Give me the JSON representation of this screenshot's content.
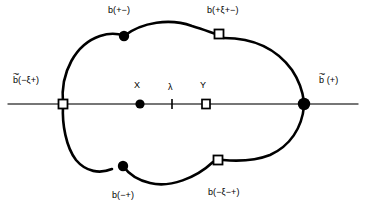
{
  "figure": {
    "background_color": "#ffffff",
    "stroke_color": "#000000",
    "axis_color": "#555555",
    "width": 366,
    "height": 216,
    "labels": {
      "top_left_node": "b(+−)",
      "top_right_node": "b(+ξ+−)",
      "left_axis_node_prefix": "b",
      "left_axis_node_suffix": "(−ξ+)",
      "right_axis_node_prefix": "b",
      "right_axis_node_suffix": " (+)",
      "axis_point_x": "X",
      "axis_point_lambda": "λ",
      "axis_point_y": "Y",
      "bottom_left_node": "b(−+)",
      "bottom_right_node": "b(−ξ−+)",
      "tilde_mark": "~"
    },
    "markers": [
      {
        "name": "top-left-filled-dot",
        "shape": "filled-circle",
        "x": 124,
        "y": 36,
        "r": 5
      },
      {
        "name": "top-right-open-square",
        "shape": "open-square",
        "x": 219,
        "y": 34,
        "size": 9
      },
      {
        "name": "left-axis-open-square",
        "shape": "open-square",
        "x": 63,
        "y": 104,
        "size": 9
      },
      {
        "name": "right-axis-filled-dot",
        "shape": "filled-circle",
        "x": 304,
        "y": 104,
        "r": 6
      },
      {
        "name": "axis-point-x-filled-dot",
        "shape": "filled-circle",
        "x": 140,
        "y": 104,
        "r": 4.5
      },
      {
        "name": "axis-point-lambda-tick",
        "shape": "tick",
        "x": 172,
        "y": 104,
        "size": 9
      },
      {
        "name": "axis-point-y-open-square",
        "shape": "open-square",
        "x": 206,
        "y": 104,
        "size": 8
      },
      {
        "name": "bottom-left-filled-dot",
        "shape": "filled-circle",
        "x": 123,
        "y": 166,
        "r": 5
      },
      {
        "name": "bottom-right-open-square",
        "shape": "open-square",
        "x": 218,
        "y": 160,
        "size": 9
      }
    ],
    "axis": {
      "x_start": 8,
      "x_end": 358,
      "y": 104
    }
  }
}
